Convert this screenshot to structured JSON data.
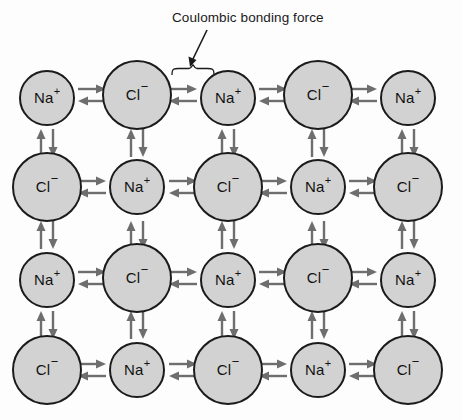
{
  "figure": {
    "width": 462,
    "height": 420,
    "background_color": "#fdfdfd",
    "ion_fill_color": "#d2d2d2",
    "ion_stroke_color": "#1b1b1b",
    "arrow_color": "#6e6e6e",
    "text_color": "#1a1a1a"
  },
  "annotation": {
    "label": "Coulombic bonding force",
    "pointer": "diagonal-arrow",
    "brace": "curly-brace"
  },
  "ion_types": {
    "sodium": {
      "symbol": "Na",
      "charge": "+",
      "diameter": 56
    },
    "chloride": {
      "symbol": "Cl",
      "charge": "−",
      "diameter": 70
    }
  },
  "lattice": {
    "columns_x": [
      47,
      137,
      228,
      318,
      408
    ],
    "rows_y": [
      98,
      187,
      280,
      370
    ],
    "grid": [
      [
        {
          "type": "sodium",
          "symbol": "Na",
          "charge": "+",
          "x": 47,
          "y": 98,
          "d": 56
        },
        {
          "type": "chloride",
          "symbol": "Cl",
          "charge": "−",
          "x": 137,
          "y": 95,
          "d": 70
        },
        {
          "type": "sodium",
          "symbol": "Na",
          "charge": "+",
          "x": 228,
          "y": 98,
          "d": 56
        },
        {
          "type": "chloride",
          "symbol": "Cl",
          "charge": "−",
          "x": 318,
          "y": 95,
          "d": 70
        },
        {
          "type": "sodium",
          "symbol": "Na",
          "charge": "+",
          "x": 408,
          "y": 98,
          "d": 56
        }
      ],
      [
        {
          "type": "chloride",
          "symbol": "Cl",
          "charge": "−",
          "x": 47,
          "y": 187,
          "d": 70
        },
        {
          "type": "sodium",
          "symbol": "Na",
          "charge": "+",
          "x": 137,
          "y": 187,
          "d": 56
        },
        {
          "type": "chloride",
          "symbol": "Cl",
          "charge": "−",
          "x": 228,
          "y": 187,
          "d": 70
        },
        {
          "type": "sodium",
          "symbol": "Na",
          "charge": "+",
          "x": 318,
          "y": 187,
          "d": 56
        },
        {
          "type": "chloride",
          "symbol": "Cl",
          "charge": "−",
          "x": 408,
          "y": 187,
          "d": 70
        }
      ],
      [
        {
          "type": "sodium",
          "symbol": "Na",
          "charge": "+",
          "x": 47,
          "y": 280,
          "d": 56
        },
        {
          "type": "chloride",
          "symbol": "Cl",
          "charge": "−",
          "x": 137,
          "y": 278,
          "d": 70
        },
        {
          "type": "sodium",
          "symbol": "Na",
          "charge": "+",
          "x": 228,
          "y": 280,
          "d": 56
        },
        {
          "type": "chloride",
          "symbol": "Cl",
          "charge": "−",
          "x": 318,
          "y": 278,
          "d": 70
        },
        {
          "type": "sodium",
          "symbol": "Na",
          "charge": "+",
          "x": 408,
          "y": 280,
          "d": 56
        }
      ],
      [
        {
          "type": "chloride",
          "symbol": "Cl",
          "charge": "−",
          "x": 47,
          "y": 370,
          "d": 70
        },
        {
          "type": "sodium",
          "symbol": "Na",
          "charge": "+",
          "x": 137,
          "y": 370,
          "d": 56
        },
        {
          "type": "chloride",
          "symbol": "Cl",
          "charge": "−",
          "x": 228,
          "y": 370,
          "d": 70
        },
        {
          "type": "sodium",
          "symbol": "Na",
          "charge": "+",
          "x": 318,
          "y": 370,
          "d": 56
        },
        {
          "type": "chloride",
          "symbol": "Cl",
          "charge": "−",
          "x": 408,
          "y": 370,
          "d": 70
        }
      ]
    ],
    "horizontal_bonds": [
      {
        "x": 92,
        "y": 95
      },
      {
        "x": 183,
        "y": 95
      },
      {
        "x": 273,
        "y": 95
      },
      {
        "x": 363,
        "y": 95
      },
      {
        "x": 92,
        "y": 187
      },
      {
        "x": 183,
        "y": 187
      },
      {
        "x": 273,
        "y": 187
      },
      {
        "x": 363,
        "y": 187
      },
      {
        "x": 92,
        "y": 278
      },
      {
        "x": 183,
        "y": 278
      },
      {
        "x": 273,
        "y": 278
      },
      {
        "x": 363,
        "y": 278
      },
      {
        "x": 92,
        "y": 370
      },
      {
        "x": 183,
        "y": 370
      },
      {
        "x": 273,
        "y": 370
      },
      {
        "x": 363,
        "y": 370
      }
    ],
    "vertical_bonds": [
      {
        "x": 47,
        "y": 143
      },
      {
        "x": 137,
        "y": 143
      },
      {
        "x": 228,
        "y": 143
      },
      {
        "x": 318,
        "y": 143
      },
      {
        "x": 408,
        "y": 143
      },
      {
        "x": 47,
        "y": 235
      },
      {
        "x": 137,
        "y": 235
      },
      {
        "x": 228,
        "y": 235
      },
      {
        "x": 318,
        "y": 235
      },
      {
        "x": 408,
        "y": 235
      },
      {
        "x": 47,
        "y": 325
      },
      {
        "x": 137,
        "y": 325
      },
      {
        "x": 228,
        "y": 325
      },
      {
        "x": 318,
        "y": 325
      },
      {
        "x": 408,
        "y": 325
      }
    ],
    "bond_directions": {
      "horizontal": [
        "right",
        "left"
      ],
      "vertical": [
        "up",
        "down"
      ]
    }
  }
}
